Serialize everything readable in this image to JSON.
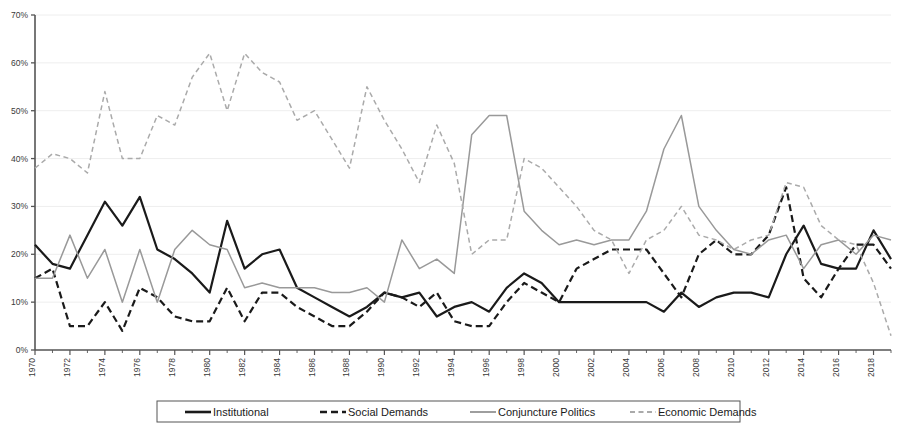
{
  "chart_data": {
    "type": "line",
    "title": "",
    "subtitle": "",
    "xlabel": "",
    "ylabel": "",
    "xlim": [
      1970,
      2019
    ],
    "ylim": [
      0,
      70
    ],
    "y_tick_step": 10,
    "y_tick_suffix": "%",
    "y_ticks": [
      "0%",
      "10%",
      "20%",
      "30%",
      "40%",
      "50%",
      "60%",
      "70%"
    ],
    "x_tick_step": 2,
    "x_ticks": [
      "1970",
      "1972",
      "1974",
      "1976",
      "1978",
      "1980",
      "1982",
      "1984",
      "1986",
      "1988",
      "1990",
      "1992",
      "1994",
      "1996",
      "1998",
      "2000",
      "2002",
      "2004",
      "2006",
      "2008",
      "2010",
      "2012",
      "2014",
      "2016",
      "2018"
    ],
    "x_tick_rotation": -90,
    "grid": "horizontal-faint",
    "legend_position": "bottom",
    "x": [
      1970,
      1971,
      1972,
      1973,
      1974,
      1975,
      1976,
      1977,
      1978,
      1979,
      1980,
      1981,
      1982,
      1983,
      1984,
      1985,
      1986,
      1987,
      1988,
      1989,
      1990,
      1991,
      1992,
      1993,
      1994,
      1995,
      1996,
      1997,
      1998,
      1999,
      2000,
      2001,
      2002,
      2003,
      2004,
      2005,
      2006,
      2007,
      2008,
      2009,
      2010,
      2011,
      2012,
      2013,
      2014,
      2015,
      2016,
      2017,
      2018,
      2019
    ],
    "series": [
      {
        "name": "Institutional",
        "color": "#1a1a1a",
        "style": "solid",
        "width": 2.2,
        "values": [
          22,
          18,
          17,
          24,
          31,
          26,
          32,
          21,
          19,
          16,
          12,
          27,
          17,
          20,
          21,
          13,
          11,
          9,
          7,
          9,
          12,
          11,
          12,
          7,
          9,
          10,
          8,
          13,
          16,
          14,
          10,
          10,
          10,
          10,
          10,
          10,
          8,
          12,
          9,
          11,
          12,
          12,
          11,
          20,
          26,
          18,
          17,
          17,
          25,
          19
        ]
      },
      {
        "name": "Social Demands",
        "color": "#1a1a1a",
        "style": "dashed",
        "width": 2.2,
        "values": [
          15,
          17,
          5,
          5,
          10,
          4,
          13,
          11,
          7,
          6,
          6,
          13,
          6,
          12,
          12,
          9,
          7,
          5,
          5,
          8,
          12,
          11,
          9,
          12,
          6,
          5,
          5,
          10,
          14,
          12,
          10,
          17,
          19,
          21,
          21,
          21,
          16,
          11,
          20,
          23,
          20,
          20,
          24,
          34,
          15,
          11,
          17,
          22,
          22,
          17
        ]
      },
      {
        "name": "Conjuncture Politics",
        "color": "#999999",
        "style": "solid",
        "width": 1.5,
        "values": [
          15,
          15,
          24,
          15,
          21,
          10,
          21,
          10,
          21,
          25,
          22,
          21,
          13,
          14,
          13,
          13,
          13,
          12,
          12,
          13,
          10,
          23,
          17,
          19,
          16,
          45,
          49,
          49,
          29,
          25,
          22,
          23,
          22,
          23,
          23,
          29,
          42,
          49,
          30,
          25,
          21,
          20,
          23,
          24,
          17,
          22,
          23,
          20,
          24,
          23
        ]
      },
      {
        "name": "Economic Demands",
        "color": "#aaaaaa",
        "style": "dashed",
        "width": 1.5,
        "values": [
          38,
          41,
          40,
          37,
          54,
          40,
          40,
          49,
          47,
          57,
          62,
          50,
          62,
          58,
          56,
          48,
          50,
          44,
          38,
          55,
          48,
          42,
          35,
          47,
          39,
          20,
          23,
          23,
          40,
          38,
          34,
          30,
          25,
          23,
          16,
          23,
          25,
          30,
          24,
          23,
          21,
          23,
          24,
          35,
          34,
          26,
          23,
          22,
          14,
          3
        ]
      }
    ]
  },
  "legend": {
    "items": [
      {
        "label": "Institutional"
      },
      {
        "label": "Social Demands"
      },
      {
        "label": "Conjuncture Politics"
      },
      {
        "label": "Economic Demands"
      }
    ]
  }
}
